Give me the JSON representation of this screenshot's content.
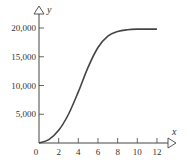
{
  "chart_data": {
    "type": "line",
    "title": "",
    "xlabel": "x",
    "ylabel": "y",
    "xlim": [
      0,
      13
    ],
    "ylim": [
      0,
      21000
    ],
    "x_ticks": [
      0,
      2,
      4,
      6,
      8,
      10,
      12
    ],
    "x_tick_labels": [
      "0",
      "2",
      "4",
      "6",
      "8",
      "10",
      "12"
    ],
    "y_ticks": [
      5000,
      10000,
      15000,
      20000
    ],
    "y_tick_labels": [
      "5,000",
      "10,000",
      "15,000",
      "20,000"
    ],
    "grid": false,
    "legend": null,
    "series": [
      {
        "name": "logistic curve",
        "x": [
          0,
          1,
          2,
          3,
          4,
          5,
          6,
          7,
          8,
          9,
          10,
          11,
          12
        ],
        "values": [
          0,
          600,
          2200,
          5000,
          8900,
          13200,
          16600,
          18600,
          19400,
          19700,
          19800,
          19800,
          19800
        ]
      }
    ]
  },
  "axes": {
    "x_label": "x",
    "y_label": "y",
    "origin_label": "0"
  }
}
